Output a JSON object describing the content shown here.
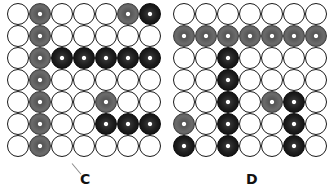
{
  "legend": {
    "cell_states": {
      "W": "empty white circle",
      "G": "gray filled circle with white center dot",
      "B": "black filled circle with white center dot"
    },
    "colors": {
      "white": "#ffffff",
      "gray": "#606060",
      "black": "#141414",
      "outline": "#1a1a1a"
    }
  },
  "panels": [
    {
      "label": "C",
      "rows": [
        [
          "W",
          "G",
          "W",
          "W",
          "W",
          "G",
          "B"
        ],
        [
          "W",
          "G",
          "W",
          "W",
          "W",
          "W",
          "W"
        ],
        [
          "W",
          "G",
          "B",
          "B",
          "B",
          "B",
          "B"
        ],
        [
          "W",
          "G",
          "W",
          "W",
          "W",
          "W",
          "W"
        ],
        [
          "W",
          "G",
          "W",
          "W",
          "G",
          "W",
          "W"
        ],
        [
          "W",
          "G",
          "W",
          "W",
          "B",
          "B",
          "B"
        ],
        [
          "W",
          "G",
          "W",
          "W",
          "W",
          "W",
          "W"
        ]
      ]
    },
    {
      "label": "D",
      "rows": [
        [
          "W",
          "W",
          "W",
          "W",
          "W",
          "W",
          "W"
        ],
        [
          "G",
          "G",
          "G",
          "G",
          "G",
          "G",
          "G"
        ],
        [
          "W",
          "W",
          "B",
          "W",
          "W",
          "W",
          "W"
        ],
        [
          "W",
          "W",
          "B",
          "W",
          "W",
          "W",
          "W"
        ],
        [
          "W",
          "W",
          "B",
          "W",
          "G",
          "B",
          "W"
        ],
        [
          "G",
          "W",
          "B",
          "W",
          "W",
          "B",
          "W"
        ],
        [
          "B",
          "W",
          "B",
          "W",
          "W",
          "B",
          "W"
        ]
      ]
    }
  ]
}
